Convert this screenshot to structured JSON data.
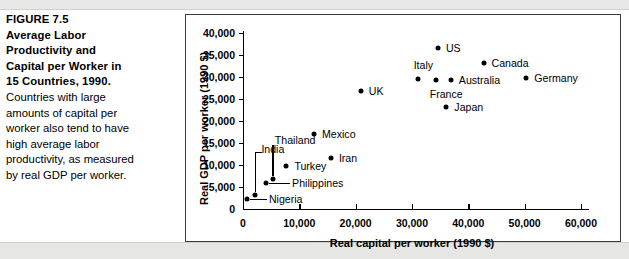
{
  "figure": {
    "number_line": "FIGURE 7.5",
    "title_lines": [
      "Average Labor",
      "Productivity and",
      "Capital per Worker in",
      "15 Countries, 1990."
    ],
    "body_lines": [
      "Countries with large",
      "amounts of capital per",
      "worker also tend to have",
      "high average labor",
      "productivity, as measured",
      "by real GDP per worker."
    ]
  },
  "chart_data": {
    "type": "scatter",
    "title": "",
    "xlabel": "Real capital per worker (1990 $)",
    "ylabel": "Real GDP per worker (1990 $)",
    "xlim": [
      0,
      62000
    ],
    "ylim": [
      0,
      41000
    ],
    "xticks": [
      0,
      10000,
      20000,
      30000,
      40000,
      50000,
      60000
    ],
    "xticklabels": [
      "0",
      "10,000",
      "20,000",
      "30,000",
      "40,000",
      "50,000",
      "60,000"
    ],
    "yticks": [
      0,
      5000,
      10000,
      15000,
      20000,
      25000,
      30000,
      35000,
      40000
    ],
    "yticklabels": [
      "0",
      "5,000",
      "10,000",
      "15,000",
      "20,000",
      "25,000",
      "30,000",
      "35,000",
      "40,000"
    ],
    "grid": false,
    "legend": "none",
    "marker_color": "#000000",
    "points": [
      {
        "name": "Nigeria",
        "x": 700,
        "y": 2200,
        "label_dx": 22,
        "label_dy": 0,
        "leader": "h"
      },
      {
        "name": "India",
        "x": 2200,
        "y": 3200,
        "label_dx": 6,
        "label_dy": -46,
        "leader": "elbow"
      },
      {
        "name": "Philippines",
        "x": 4100,
        "y": 5800,
        "label_dx": 26,
        "label_dy": 0,
        "leader": "h"
      },
      {
        "name": "Thailand",
        "x": 5300,
        "y": 6900,
        "label_dx": 2,
        "label_dy": -39,
        "leader": "v"
      },
      {
        "name": "Turkey",
        "x": 7700,
        "y": 9700,
        "label_dx": 8,
        "label_dy": 0,
        "leader": "none"
      },
      {
        "name": "Mexico",
        "x": 12600,
        "y": 17100,
        "label_dx": 8,
        "label_dy": 0,
        "leader": "none"
      },
      {
        "name": "Iran",
        "x": 15600,
        "y": 11500,
        "label_dx": 8,
        "label_dy": 0,
        "leader": "none"
      },
      {
        "name": "UK",
        "x": 20900,
        "y": 26800,
        "label_dx": 8,
        "label_dy": 0,
        "leader": "none"
      },
      {
        "name": "Italy",
        "x": 31000,
        "y": 29600,
        "label_dx": -4,
        "label_dy": -14,
        "leader": "none"
      },
      {
        "name": "France",
        "x": 34200,
        "y": 29300,
        "label_dx": -6,
        "label_dy": 14,
        "leader": "none"
      },
      {
        "name": "US",
        "x": 34600,
        "y": 36600,
        "label_dx": 8,
        "label_dy": 0,
        "leader": "none"
      },
      {
        "name": "Australia",
        "x": 36900,
        "y": 29300,
        "label_dx": 8,
        "label_dy": 0,
        "leader": "none"
      },
      {
        "name": "Japan",
        "x": 36100,
        "y": 23100,
        "label_dx": 8,
        "label_dy": 0,
        "leader": "none"
      },
      {
        "name": "Canada",
        "x": 42700,
        "y": 33200,
        "label_dx": 8,
        "label_dy": 0,
        "leader": "none"
      },
      {
        "name": "Germany",
        "x": 50300,
        "y": 29700,
        "label_dx": 8,
        "label_dy": 0,
        "leader": "none"
      }
    ]
  }
}
